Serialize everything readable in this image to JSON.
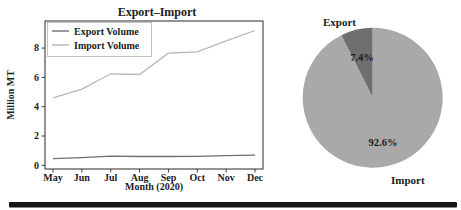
{
  "page": {
    "background": "#ffffff",
    "divider_color": "#161616"
  },
  "chart_data": [
    {
      "type": "line",
      "title": "Export–Import",
      "xlabel": "Month (2020)",
      "ylabel": "Million MT",
      "categories": [
        "May",
        "Jun",
        "Jul",
        "Aug",
        "Sep",
        "Oct",
        "Nov",
        "Dec"
      ],
      "series": [
        {
          "name": "Export Volume",
          "color": "#6f6f6f",
          "values": [
            0.45,
            0.52,
            0.63,
            0.6,
            0.6,
            0.62,
            0.66,
            0.7
          ]
        },
        {
          "name": "Import Volume",
          "color": "#b7b7b7",
          "values": [
            4.6,
            5.2,
            6.25,
            6.2,
            7.65,
            7.75,
            8.5,
            9.2
          ]
        }
      ],
      "ytick_labels": [
        "0",
        "2",
        "4",
        "6",
        "8"
      ],
      "ytick_values": [
        0,
        2,
        4,
        6,
        8
      ],
      "ylim": [
        -0.25,
        9.85
      ],
      "grid": false,
      "legend_position": "upper left",
      "axis_color": "#2b2b2b",
      "text_color": "#1c1c1c",
      "legend_border_color": "#b5b5b5"
    },
    {
      "type": "pie",
      "labels": [
        "Export",
        "Import"
      ],
      "values": [
        7.4,
        92.6
      ],
      "percent_labels": [
        "7.4%",
        "92.6%"
      ],
      "colors": [
        "#6f6f6f",
        "#a9a9a9"
      ],
      "start_angle": 90,
      "counterclock": true,
      "text_color": "#1c1c1c"
    }
  ]
}
